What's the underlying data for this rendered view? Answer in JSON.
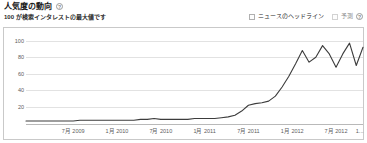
{
  "header": {
    "title": "人気度の動向",
    "help_icon": "question-mark-icon",
    "subtitle": "100 が検索インタレストの最大値です",
    "legend": [
      {
        "label": "ニュースのヘッドライン",
        "checked": false,
        "has_help": false
      },
      {
        "label": "予測",
        "checked": false,
        "has_help": true,
        "help_icon": "question-mark-icon"
      }
    ]
  },
  "chart_data": {
    "type": "line",
    "title": "人気度の動向",
    "subtitle": "100 が検索インタレストの最大値です",
    "xlabel": "",
    "ylabel": "",
    "ylim": [
      0,
      108
    ],
    "yticks": [
      20,
      40,
      60,
      80,
      100
    ],
    "ytick_labels": [
      "20",
      "40",
      "60",
      "80",
      "100"
    ],
    "grid": true,
    "legend_position": "top-right",
    "xtick_labels": [
      "7月 2009",
      "1月 2010",
      "7月 2010",
      "1月 2011",
      "7月 2011",
      "1月 2012",
      "7月 2012",
      "1..."
    ],
    "xtick_positions": [
      14.0,
      27.0,
      40.0,
      53.0,
      66.0,
      79.0,
      92.0,
      99.0
    ],
    "series": [
      {
        "name": "検索インタレスト",
        "color": "#3c3c3c",
        "x": [
          0,
          2,
          4,
          6,
          8,
          10,
          12,
          14,
          16,
          18,
          20,
          22,
          24,
          26,
          28,
          30,
          32,
          34,
          36,
          38,
          40,
          42,
          44,
          46,
          48,
          50,
          52,
          54,
          56,
          58,
          60,
          62,
          64,
          66,
          68,
          70,
          72,
          74,
          76,
          78,
          80,
          82,
          84,
          86,
          88,
          90,
          92,
          94,
          96,
          98,
          100
        ],
        "values": [
          3,
          3,
          3,
          3,
          3,
          3,
          3,
          3,
          4,
          4,
          4,
          4,
          4,
          4,
          4,
          4,
          4,
          5,
          5,
          6,
          5,
          5,
          5,
          5,
          5,
          6,
          6,
          6,
          6,
          7,
          8,
          10,
          15,
          22,
          24,
          25,
          27,
          33,
          44,
          57,
          72,
          88,
          74,
          80,
          94,
          84,
          68,
          84,
          97,
          70,
          92
        ]
      }
    ]
  }
}
